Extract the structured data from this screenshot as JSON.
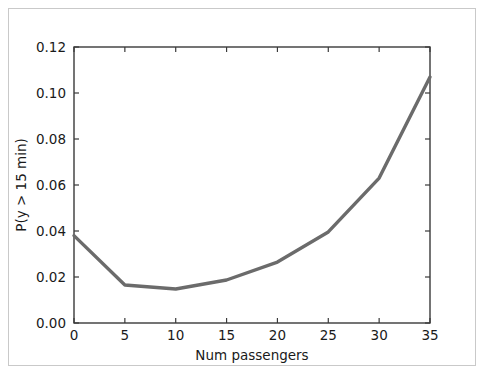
{
  "figure": {
    "background_color": "#ffffff",
    "frame_color": "#c9c9c9",
    "axis_color": "#3a3a3a"
  },
  "chart_data": {
    "type": "line",
    "title": "",
    "xlabel": "Num passengers",
    "ylabel": "P(y > 15 min)",
    "x": [
      0,
      5,
      10,
      15,
      20,
      25,
      30,
      35
    ],
    "values": [
      0.038,
      0.0165,
      0.0148,
      0.0187,
      0.0265,
      0.0396,
      0.063,
      0.107
    ],
    "series": [
      {
        "name": "P(y > 15 min)",
        "color": "#6b6b6b",
        "line_width": 3.4,
        "values": [
          0.038,
          0.0165,
          0.0148,
          0.0187,
          0.0265,
          0.0396,
          0.063,
          0.107
        ]
      }
    ],
    "xlim": [
      0,
      35
    ],
    "ylim": [
      0.0,
      0.12
    ],
    "xticks": [
      0,
      5,
      10,
      15,
      20,
      25,
      30,
      35
    ],
    "xtick_labels": [
      "0",
      "5",
      "10",
      "15",
      "20",
      "25",
      "30",
      "35"
    ],
    "yticks": [
      0.0,
      0.02,
      0.04,
      0.06,
      0.08,
      0.1,
      0.12
    ],
    "ytick_labels": [
      "0.00",
      "0.02",
      "0.04",
      "0.06",
      "0.08",
      "0.10",
      "0.12"
    ],
    "grid": false,
    "legend": false,
    "legend_position": "none"
  }
}
